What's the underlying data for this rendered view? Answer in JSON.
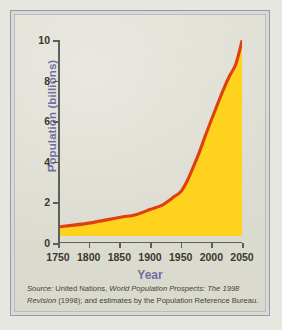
{
  "figure": {
    "background_color": "#dbdad0",
    "frame_color": "#8e9bb4"
  },
  "axis_title": {
    "y": "Population (billions)",
    "x": "Year",
    "color": "#6f6f9f"
  },
  "caption": {
    "line1_lead": "Source:",
    "line1_rest_a": " United Nations, ",
    "line1_italic": "World Population Prospects: The 1998",
    "line2_italic": "Revision",
    "line2_rest": " (1998); and estimates by the Population Reference Bureau."
  },
  "chart_data": {
    "type": "area",
    "title": "",
    "subtitle": "",
    "xlabel": "Year",
    "ylabel": "Population (billions)",
    "xlim": [
      1750,
      2050
    ],
    "ylim": [
      0,
      10
    ],
    "xticks": [
      1750,
      1800,
      1850,
      1900,
      1950,
      2000,
      2050
    ],
    "xtick_labels": [
      "1750",
      "1800",
      "1850",
      "1900",
      "1950",
      "2000",
      "2050"
    ],
    "yticks": [
      0,
      2,
      4,
      6,
      8,
      10
    ],
    "ytick_labels": [
      "0",
      "2",
      "4",
      "6",
      "8",
      "10"
    ],
    "grid": false,
    "legend": "none",
    "line_color": "#e0400f",
    "fill_color": "#ffd21e",
    "baseline_value": 0.35,
    "series": [
      {
        "name": "World population",
        "x": [
          1750,
          1800,
          1850,
          1875,
          1900,
          1910,
          1920,
          1930,
          1940,
          1950,
          1960,
          1970,
          1980,
          1990,
          2000,
          2010,
          2020,
          2030,
          2040,
          2050
        ],
        "values": [
          0.79,
          0.98,
          1.26,
          1.38,
          1.65,
          1.75,
          1.86,
          2.07,
          2.3,
          2.52,
          3.02,
          3.7,
          4.44,
          5.27,
          6.06,
          6.83,
          7.58,
          8.25,
          8.82,
          9.95
        ]
      }
    ],
    "annotations": []
  }
}
